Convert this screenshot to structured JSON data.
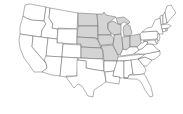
{
  "map": {
    "subject": "United States (contiguous)",
    "highlighted_region": "Midwest",
    "colors": {
      "background": "#ffffff",
      "state_fill": "#ffffff",
      "highlight_fill": "#d4d4d4",
      "border": "#555555"
    },
    "highlighted_states": [
      "ND",
      "SD",
      "NE",
      "KS",
      "MN",
      "IA",
      "MO",
      "WI",
      "IL",
      "MI",
      "IN",
      "OH"
    ],
    "states": [
      {
        "id": "WA",
        "hl": false,
        "d": "M25,5 L30,4 L46,7 L44,21 L31,20 L26,18 L23,16 Z"
      },
      {
        "id": "OR",
        "hl": false,
        "d": "M23,16 L26,18 L31,20 L44,21 L46,24 L42,30 L41,37 L20,34 L20,27 Z"
      },
      {
        "id": "CA",
        "hl": false,
        "d": "M20,34 L33,36 L32,47 L46,63 L47,68 L42,72 L34,72 L30,66 L24,58 L20,48 L19,40 Z"
      },
      {
        "id": "ID",
        "hl": false,
        "d": "M46,7 L50,8 L49,18 L53,24 L52,28 L58,29 L57,39 L41,37 L42,30 L46,24 L44,21 Z"
      },
      {
        "id": "NV",
        "hl": false,
        "d": "M33,36 L48,38 L46,58 L44,60 L46,63 L32,47 Z"
      },
      {
        "id": "MT",
        "hl": false,
        "d": "M50,8 L78,13 L77,29 L58,28 L58,29 L52,28 L53,24 L49,18 Z"
      },
      {
        "id": "WY",
        "hl": false,
        "d": "M58,29 L77,29 L77,44 L57,43 Z"
      },
      {
        "id": "UT",
        "hl": false,
        "d": "M48,38 L57,39 L57,43 L63,43 L62,57 L46,56 Z"
      },
      {
        "id": "CO",
        "hl": false,
        "d": "M63,44 L81,45 L81,58 L62,57 Z"
      },
      {
        "id": "AZ",
        "hl": false,
        "d": "M46,56 L62,57 L60,76 L52,75 L42,72 L47,68 L46,63 L44,60 Z"
      },
      {
        "id": "NM",
        "hl": false,
        "d": "M62,57 L78,58 L77,76 L66,76 L66,77 L60,76 Z"
      },
      {
        "id": "ND",
        "hl": true,
        "d": "M78,13 L97,14 L98,26 L78,26 Z"
      },
      {
        "id": "SD",
        "hl": true,
        "d": "M78,26 L98,26 L98,39 L95,38 L77,37 Z"
      },
      {
        "id": "NE",
        "hl": true,
        "d": "M77,37 L95,38 L98,40 L101,48 L81,47 L81,44 L77,44 Z"
      },
      {
        "id": "KS",
        "hl": true,
        "d": "M81,47 L101,48 L103,51 L103,59 L81,58 Z"
      },
      {
        "id": "OK",
        "hl": false,
        "d": "M78,58 L103,59 L104,71 L96,70 L86,68 L86,61 L78,60 Z"
      },
      {
        "id": "TX",
        "hl": false,
        "d": "M77,60 L86,61 L86,68 L96,70 L104,71 L106,82 L100,86 L94,90 L93,97 L88,96 L82,86 L78,84 L74,88 L66,77 L77,76 Z"
      },
      {
        "id": "MN",
        "hl": true,
        "d": "M97,14 L103,14 L104,12 L106,15 L116,17 L108,23 L108,29 L111,33 L111,35 L98,35 L98,26 Z"
      },
      {
        "id": "IA",
        "hl": true,
        "d": "M98,35 L111,35 L114,39 L113,44 L103,45 L101,46 L98,40 Z"
      },
      {
        "id": "MO",
        "hl": true,
        "d": "M101,46 L113,45 L116,51 L118,55 L119,60 L116,61 L104,61 L103,51 Z"
      },
      {
        "id": "AR",
        "hl": false,
        "d": "M104,61 L116,61 L117,63 L114,71 L105,72 L104,71 Z"
      },
      {
        "id": "LA",
        "hl": false,
        "d": "M105,72 L114,71 L113,76 L120,77 L119,84 L106,82 Z"
      },
      {
        "id": "WI",
        "hl": true,
        "d": "M108,23 L113,21 L118,24 L121,24 L121,34 L114,35 L111,33 L108,29 Z"
      },
      {
        "id": "IL",
        "hl": true,
        "d": "M114,35 L121,34 L122,38 L123,49 L120,55 L118,55 L116,51 L113,45 L114,39 Z"
      },
      {
        "id": "MI",
        "hl": true,
        "d": "M116,18 L124,17 L130,22 L128,24 L124,22 L121,24 L118,24 Z M124,26 L127,24 L130,26 L132,33 L130,36 L124,36 L123,30 Z"
      },
      {
        "id": "IN",
        "hl": true,
        "d": "M123,37 L130,36 L130,47 L126,50 L123,49 L122,38 Z"
      },
      {
        "id": "OH",
        "hl": true,
        "d": "M130,36 L134,35 L140,34 L141,43 L137,47 L133,47 L130,47 Z"
      },
      {
        "id": "KY",
        "hl": false,
        "d": "M120,55 L123,49 L126,50 L130,47 L133,47 L137,47 L139,50 L134,54 L121,56 Z"
      },
      {
        "id": "TN",
        "hl": false,
        "d": "M118,57 L134,55 L145,54 L143,58 L138,60 L117,61 Z"
      },
      {
        "id": "MS",
        "hl": false,
        "d": "M117,61 L124,61 L124,78 L120,78 L120,77 L113,76 L114,71 Z"
      },
      {
        "id": "AL",
        "hl": false,
        "d": "M124,61 L131,60 L133,74 L129,75 L128,78 L124,78 Z"
      },
      {
        "id": "GA",
        "hl": false,
        "d": "M131,60 L138,59 L144,66 L146,70 L144,74 L135,75 L133,74 Z"
      },
      {
        "id": "FL",
        "hl": false,
        "d": "M124,78 L128,78 L129,75 L135,75 L144,74 L146,77 L151,87 L153,96 L150,97 L145,90 L141,82 L137,79 L131,79 Z"
      },
      {
        "id": "SC",
        "hl": false,
        "d": "M138,59 L145,57 L152,60 L147,66 L144,66 Z"
      },
      {
        "id": "NC",
        "hl": false,
        "d": "M138,59 L143,56 L145,54 L160,51 L160,55 L155,59 L152,60 L145,57 Z"
      },
      {
        "id": "VA",
        "hl": false,
        "d": "M134,54 L139,50 L143,48 L147,44 L152,44 L156,48 L160,51 L145,54 Z"
      },
      {
        "id": "WV",
        "hl": false,
        "d": "M137,47 L141,43 L143,43 L145,41 L148,42 L147,44 L143,48 L139,50 Z"
      },
      {
        "id": "PA",
        "hl": false,
        "d": "M140,34 L142,32 L157,31 L159,34 L157,39 L141,40 Z"
      },
      {
        "id": "NY",
        "hl": false,
        "d": "M142,32 L147,28 L152,27 L155,20 L160,18 L162,28 L163,34 L159,34 L157,31 Z"
      },
      {
        "id": "MD",
        "hl": false,
        "d": "M143,41 L155,40 L157,44 L155,45 L152,44 L147,44 L148,42 L145,41 Z"
      },
      {
        "id": "DE",
        "hl": false,
        "d": "M155,40 L157,39 L158,43 L157,44 Z"
      },
      {
        "id": "NJ",
        "hl": false,
        "d": "M157,34 L159,34 L160,37 L159,41 L157,39 L158,36 Z"
      },
      {
        "id": "CT",
        "hl": false,
        "d": "M162,29 L166,28 L166,31 L163,32 Z"
      },
      {
        "id": "RI",
        "hl": false,
        "d": "M166,28 L168,28 L167,31 L166,31 Z"
      },
      {
        "id": "MA",
        "hl": false,
        "d": "M161,25 L168,24 L171,26 L168,28 L162,29 Z"
      },
      {
        "id": "VT",
        "hl": false,
        "d": "M160,16 L163,15 L163,24 L161,25 Z"
      },
      {
        "id": "NH",
        "hl": false,
        "d": "M163,15 L165,12 L167,23 L163,24 Z"
      },
      {
        "id": "ME",
        "hl": false,
        "d": "M165,12 L167,6 L171,5 L176,13 L172,17 L168,22 L167,23 Z"
      }
    ]
  }
}
